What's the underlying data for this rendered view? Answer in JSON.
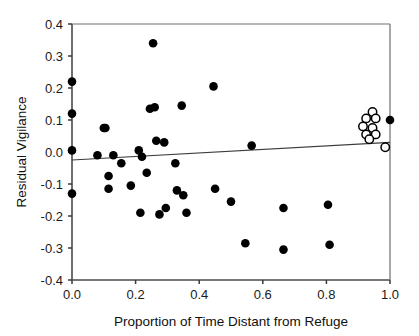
{
  "chart_data": {
    "type": "scatter",
    "title": "",
    "xlabel": "Proportion of Time Distant from Refuge",
    "ylabel": "Residual Vigilance",
    "xlim": [
      0.0,
      1.0
    ],
    "ylim": [
      -0.4,
      0.4
    ],
    "xticks": [
      0.0,
      0.2,
      0.4,
      0.6,
      0.8,
      1.0
    ],
    "xtick_labels": [
      "0.0",
      "0.2",
      "0.4",
      "0.6",
      "0.8",
      "1.0"
    ],
    "yticks": [
      -0.4,
      -0.3,
      -0.2,
      -0.1,
      0.0,
      0.1,
      0.2,
      0.3,
      0.4
    ],
    "ytick_labels": [
      "-0.4",
      "-0.3",
      "-0.2",
      "-0.1",
      "0.0",
      "0.1",
      "0.2",
      "0.3",
      "0.4"
    ],
    "grid": false,
    "legend": false,
    "series": [
      {
        "name": "filled-points",
        "marker": "filled-circle",
        "color": "#000000",
        "points": [
          [
            0.0,
            0.22
          ],
          [
            0.0,
            0.12
          ],
          [
            0.0,
            0.005
          ],
          [
            0.0,
            -0.13
          ],
          [
            0.08,
            -0.01
          ],
          [
            0.1,
            0.075
          ],
          [
            0.105,
            0.075
          ],
          [
            0.115,
            -0.075
          ],
          [
            0.115,
            -0.115
          ],
          [
            0.13,
            -0.01
          ],
          [
            0.155,
            -0.035
          ],
          [
            0.185,
            -0.105
          ],
          [
            0.21,
            0.005
          ],
          [
            0.215,
            -0.19
          ],
          [
            0.22,
            -0.015
          ],
          [
            0.235,
            -0.065
          ],
          [
            0.245,
            0.135
          ],
          [
            0.255,
            0.34
          ],
          [
            0.26,
            0.14
          ],
          [
            0.265,
            0.035
          ],
          [
            0.275,
            -0.195
          ],
          [
            0.29,
            0.03
          ],
          [
            0.295,
            -0.175
          ],
          [
            0.325,
            -0.035
          ],
          [
            0.33,
            -0.12
          ],
          [
            0.345,
            0.145
          ],
          [
            0.35,
            -0.135
          ],
          [
            0.36,
            -0.19
          ],
          [
            0.445,
            0.205
          ],
          [
            0.45,
            -0.115
          ],
          [
            0.5,
            -0.155
          ],
          [
            0.545,
            -0.285
          ],
          [
            0.565,
            0.02
          ],
          [
            0.665,
            -0.175
          ],
          [
            0.665,
            -0.305
          ],
          [
            0.805,
            -0.165
          ],
          [
            0.81,
            -0.29
          ],
          [
            1.0,
            0.1
          ]
        ]
      },
      {
        "name": "open-points",
        "marker": "open-circle",
        "color": "#000000",
        "points": [
          [
            0.945,
            0.125
          ],
          [
            0.925,
            0.105
          ],
          [
            0.955,
            0.105
          ],
          [
            0.915,
            0.08
          ],
          [
            0.945,
            0.075
          ],
          [
            0.925,
            0.055
          ],
          [
            0.955,
            0.055
          ],
          [
            0.935,
            0.04
          ],
          [
            0.985,
            0.015
          ]
        ]
      }
    ],
    "fit_line": {
      "name": "regression-line",
      "x_start": 0.0,
      "y_start": -0.025,
      "x_end": 1.0,
      "y_end": 0.03
    }
  }
}
